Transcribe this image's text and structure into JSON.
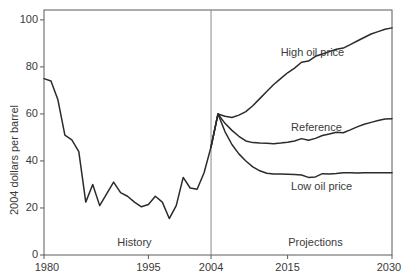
{
  "chart_data": {
    "type": "line",
    "title": "",
    "xlabel": "",
    "ylabel": "2004 dollars per barrel",
    "xlim": [
      1980,
      2030
    ],
    "ylim": [
      0,
      100
    ],
    "grid": false,
    "legend_position": "inline-annotations",
    "x_ticks": [
      "1980",
      "1995",
      "2004",
      "2015",
      "2030"
    ],
    "x_tick_values": [
      1980,
      1995,
      2004,
      2015,
      2030
    ],
    "y_ticks": [
      "0",
      "20",
      "40",
      "60",
      "80",
      "100"
    ],
    "y_tick_values": [
      0,
      20,
      40,
      60,
      80,
      100
    ],
    "annotations": [
      {
        "name": "high-oil-price-label",
        "text": "High oil price",
        "x": 2014,
        "y": 86
      },
      {
        "name": "reference-label",
        "text": "Reference",
        "x": 2015.5,
        "y": 54
      },
      {
        "name": "low-oil-price-label",
        "text": "Low oil price",
        "x": 2015.5,
        "y": 29
      },
      {
        "name": "history-label",
        "text": "History",
        "x": 1993,
        "y": 5
      },
      {
        "name": "projections-label",
        "text": "Projections",
        "x": 2019,
        "y": 5
      }
    ],
    "divider": {
      "name": "history-projection-divider",
      "x": 2004
    },
    "series": [
      {
        "name": "History",
        "color": "#2b2b2b",
        "x": [
          1980,
          1981,
          1982,
          1983,
          1984,
          1985,
          1986,
          1987,
          1988,
          1989,
          1990,
          1991,
          1992,
          1993,
          1994,
          1995,
          1996,
          1997,
          1998,
          1999,
          2000,
          2001,
          2002,
          2003,
          2004
        ],
        "values": [
          75.0,
          74.0,
          66.0,
          51.0,
          49.0,
          44.0,
          22.5,
          30.0,
          21.0,
          26.0,
          31.0,
          26.5,
          25.0,
          22.5,
          20.5,
          21.5,
          25.0,
          22.5,
          15.5,
          21.0,
          33.0,
          28.5,
          28.0,
          35.0,
          46.0
        ]
      },
      {
        "name": "Reference",
        "color": "#2b2b2b",
        "x": [
          2004,
          2005,
          2006,
          2007,
          2008,
          2009,
          2010,
          2011,
          2012,
          2013,
          2014,
          2015,
          2016,
          2017,
          2018,
          2019,
          2020,
          2021,
          2022,
          2023,
          2024,
          2025,
          2026,
          2027,
          2028,
          2029,
          2030
        ],
        "values": [
          46.0,
          60.0,
          56.0,
          53.0,
          50.5,
          48.5,
          47.8,
          47.6,
          47.5,
          47.3,
          47.6,
          48.0,
          48.5,
          49.5,
          48.8,
          49.6,
          50.8,
          51.5,
          52.2,
          52.0,
          53.2,
          54.5,
          55.6,
          56.4,
          57.2,
          57.8,
          58.0
        ]
      },
      {
        "name": "High oil price",
        "color": "#2b2b2b",
        "x": [
          2004,
          2005,
          2006,
          2007,
          2008,
          2009,
          2010,
          2011,
          2012,
          2013,
          2014,
          2015,
          2016,
          2017,
          2018,
          2019,
          2020,
          2021,
          2022,
          2023,
          2024,
          2025,
          2026,
          2027,
          2028,
          2029,
          2030
        ],
        "values": [
          46.0,
          60.0,
          59.0,
          58.5,
          59.5,
          61.0,
          63.5,
          66.5,
          69.5,
          72.5,
          75.0,
          77.5,
          79.5,
          82.0,
          82.5,
          84.5,
          85.5,
          86.5,
          87.5,
          88.0,
          89.5,
          91.0,
          92.5,
          94.0,
          95.0,
          96.0,
          96.6
        ]
      },
      {
        "name": "Low oil price",
        "color": "#2b2b2b",
        "x": [
          2004,
          2005,
          2006,
          2007,
          2008,
          2009,
          2010,
          2011,
          2012,
          2013,
          2014,
          2015,
          2016,
          2017,
          2018,
          2019,
          2020,
          2021,
          2022,
          2023,
          2024,
          2025,
          2026,
          2027,
          2028,
          2029,
          2030
        ],
        "values": [
          46.0,
          60.0,
          52.5,
          47.0,
          43.0,
          40.0,
          37.5,
          35.8,
          34.8,
          34.5,
          34.4,
          34.3,
          34.2,
          34.0,
          33.0,
          33.2,
          34.6,
          34.5,
          34.7,
          35.0,
          35.0,
          34.9,
          35.0,
          35.0,
          35.0,
          35.0,
          35.0
        ]
      }
    ]
  },
  "plot_geometry": {
    "left": 44,
    "right": 392,
    "top": 10,
    "bottom": 255
  },
  "colors": {
    "line": "#2b2b2b",
    "axis": "#5a5a5a",
    "divider": "#7a7a7a",
    "background": "#ffffff",
    "text": "#3a3a3a"
  }
}
